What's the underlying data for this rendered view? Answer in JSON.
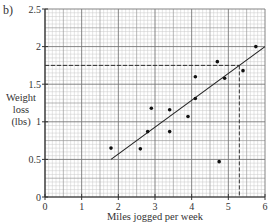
{
  "part_label": "b)",
  "chart_data": {
    "type": "scatter",
    "title": "",
    "xlabel": "Miles jogged per week",
    "ylabel": [
      "Weight",
      "loss",
      "(lbs)"
    ],
    "xlim": [
      0,
      6
    ],
    "ylim": [
      0,
      2.5
    ],
    "x_ticks": [
      0,
      1,
      2,
      3,
      4,
      5,
      6
    ],
    "x_tick_labels": [
      "0",
      "1",
      "2",
      "3",
      "4",
      "5",
      "6"
    ],
    "y_ticks": [
      0,
      0.5,
      1,
      1.5,
      2,
      2.5
    ],
    "y_tick_labels": [
      "0",
      "0.5",
      "1",
      "1.5",
      "2",
      "2.5"
    ],
    "grid": true,
    "grid_minor": {
      "x": 0.1,
      "y": 0.05
    },
    "points": [
      {
        "x": 1.8,
        "y": 0.65
      },
      {
        "x": 2.6,
        "y": 0.64
      },
      {
        "x": 2.8,
        "y": 0.87
      },
      {
        "x": 2.9,
        "y": 1.18
      },
      {
        "x": 3.4,
        "y": 1.16
      },
      {
        "x": 3.4,
        "y": 0.87
      },
      {
        "x": 3.9,
        "y": 1.07
      },
      {
        "x": 4.1,
        "y": 1.6
      },
      {
        "x": 4.1,
        "y": 1.31
      },
      {
        "x": 4.7,
        "y": 1.8
      },
      {
        "x": 4.9,
        "y": 1.58
      },
      {
        "x": 5.4,
        "y": 1.68
      },
      {
        "x": 5.75,
        "y": 2.0
      },
      {
        "x": 4.75,
        "y": 0.47
      }
    ],
    "best_fit_line": {
      "x1": 1.8,
      "y1": 0.5,
      "x2": 6.0,
      "y2": 2.0
    },
    "reference_lines": {
      "horizontal_dashed_y": 1.75,
      "vertical_dashed_x": 5.3
    }
  }
}
